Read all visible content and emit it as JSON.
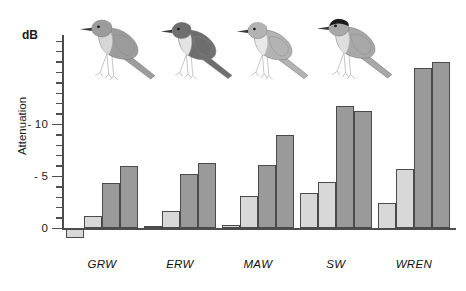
{
  "chart_data": {
    "type": "bar",
    "title": "",
    "xlabel": "",
    "ylabel": "Attenuation",
    "unit_label": "dB",
    "categories": [
      "GRW",
      "ERW",
      "MAW",
      "SW",
      "WREN"
    ],
    "ylim": [
      -18.6,
      1.0
    ],
    "y_ticks": [
      0,
      -5,
      -10
    ],
    "y_tick_labels": [
      "0",
      "- 5",
      "- 10"
    ],
    "y_minor_tick_step": 1,
    "grid": false,
    "legend": "none",
    "axis_direction": "inverted (more negative attenuation upward)",
    "series": [
      {
        "name": "light-bar-1",
        "color": "#d8d8d8",
        "values": [
          0.9,
          -0.2,
          -0.3,
          -3.4,
          -2.5
        ]
      },
      {
        "name": "light-bar-2",
        "color": "#d8d8d8",
        "values": [
          -1.2,
          -1.7,
          -3.1,
          -4.5,
          -5.7
        ]
      },
      {
        "name": "dark-bar-1",
        "color": "#9a9a9a",
        "values": [
          -4.4,
          -5.2,
          -6.1,
          -11.8,
          -15.4
        ]
      },
      {
        "name": "dark-bar-2",
        "color": "#9a9a9a",
        "values": [
          -6.0,
          -6.3,
          -9.0,
          -11.3,
          -16.0
        ]
      }
    ]
  },
  "axis": {
    "unit": "dB",
    "title": "Attenuation",
    "tick_labels": [
      "0",
      "- 5",
      "- 10"
    ]
  },
  "groups": [
    {
      "label": "GRW",
      "bird": "great-reed-warbler"
    },
    {
      "label": "ERW",
      "bird": "european-reed-warbler"
    },
    {
      "label": "MAW",
      "bird": "marsh-warbler"
    },
    {
      "label": "SW",
      "bird": "sedge-warbler-blackcap"
    },
    {
      "label": "WREN",
      "bird": "wren"
    }
  ],
  "birds": [
    {
      "name": "great-reed-warbler",
      "body_color": "#9c9c9c",
      "belly_color": "#d6d6d6",
      "cap_color": "#9c9c9c"
    },
    {
      "name": "european-reed-warbler",
      "body_color": "#6e6e6e",
      "belly_color": "#e3e3e3",
      "cap_color": "#6e6e6e"
    },
    {
      "name": "marsh-warbler",
      "body_color": "#b3b3b3",
      "belly_color": "#e8e8e8",
      "cap_color": "#b3b3b3"
    },
    {
      "name": "sedge-warbler-blackcap",
      "body_color": "#a8a8a8",
      "belly_color": "#dedede",
      "cap_color": "#1a1a1a"
    }
  ],
  "colors": {
    "light_bar": "#d8d8d8",
    "dark_bar": "#9a9a9a",
    "bar_outline": "#4a4a4a",
    "axis": "#4d4d4d",
    "text": "#111111",
    "background": "#ffffff"
  }
}
